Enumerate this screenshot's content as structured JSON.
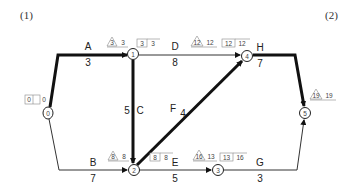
{
  "figure_labels": {
    "left": "(1)",
    "right": "(2)"
  },
  "nodes": [
    {
      "id": "0",
      "x": 48,
      "y": 113
    },
    {
      "id": "1",
      "x": 133,
      "y": 54
    },
    {
      "id": "2",
      "x": 134,
      "y": 170
    },
    {
      "id": "3",
      "x": 218,
      "y": 170
    },
    {
      "id": "4",
      "x": 247,
      "y": 56
    },
    {
      "id": "5",
      "x": 305,
      "y": 113
    }
  ],
  "activities": [
    {
      "name": "A",
      "duration": "3",
      "from": "0",
      "to": "1",
      "critical": true
    },
    {
      "name": "B",
      "duration": "7",
      "from": "0",
      "to": "2",
      "critical": false
    },
    {
      "name": "C",
      "duration": "5",
      "from": "1",
      "to": "2",
      "critical": true
    },
    {
      "name": "D",
      "duration": "8",
      "from": "1",
      "to": "4",
      "critical": false
    },
    {
      "name": "E",
      "duration": "5",
      "from": "2",
      "to": "3",
      "critical": false
    },
    {
      "name": "F",
      "duration": "4",
      "from": "2",
      "to": "4",
      "critical": true
    },
    {
      "name": "G",
      "duration": "3",
      "from": "3",
      "to": "5",
      "critical": false
    },
    {
      "name": "H",
      "duration": "7",
      "from": "4",
      "to": "5",
      "critical": true
    }
  ],
  "node_times": {
    "n0": {
      "box": [
        "0",
        "0"
      ]
    },
    "n1": {
      "tri": "3",
      "tri_val": "3",
      "box": [
        "3",
        "3"
      ]
    },
    "n2": {
      "tri": "8",
      "tri_val": "8",
      "box": [
        "8",
        "8"
      ]
    },
    "n3": {
      "tri": "16",
      "tri_val": "13",
      "box": [
        "13",
        "16"
      ]
    },
    "n4": {
      "tri": "12",
      "tri_val": "12",
      "box": [
        "12",
        "12"
      ]
    },
    "n5": {
      "tri": "19",
      "tri_val": "19"
    }
  },
  "colors": {
    "critical": "#111111",
    "normal": "#333333"
  }
}
